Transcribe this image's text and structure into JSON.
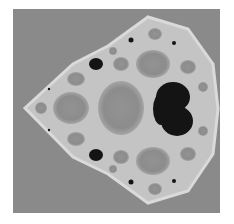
{
  "image": {
    "subject": "Julia-set style fractal rendered in grayscale",
    "colors": {
      "background": "#ffffff",
      "field": "#8a8a8a",
      "cell": "#8f8f8f",
      "edge": "#cfcfcf",
      "interior": "#151515"
    }
  }
}
